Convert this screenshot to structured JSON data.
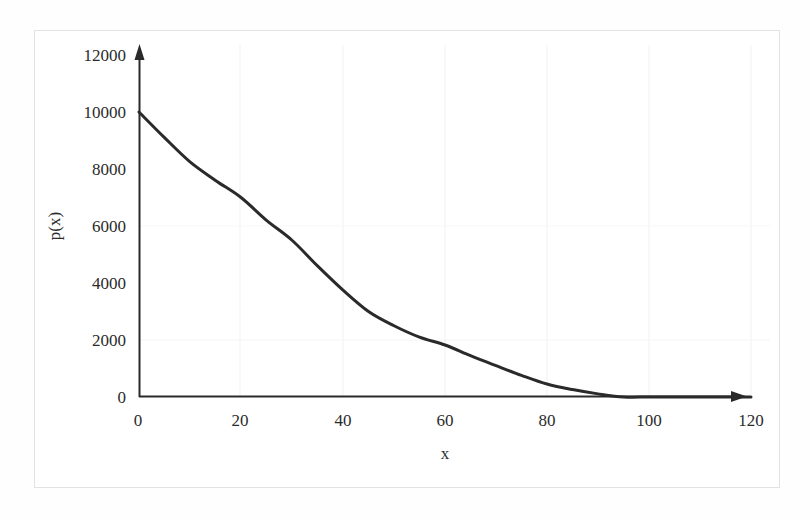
{
  "chart_data": {
    "type": "line",
    "title": "",
    "xlabel": "x",
    "ylabel": "p(x)",
    "xlim": [
      0,
      120
    ],
    "ylim": [
      0,
      12000
    ],
    "xticks": [
      0,
      20,
      40,
      60,
      80,
      100,
      120
    ],
    "yticks": [
      0,
      2000,
      4000,
      6000,
      8000,
      10000,
      12000
    ],
    "xtick_labels": [
      "0",
      "20",
      "40",
      "60",
      "80",
      "100",
      "120"
    ],
    "ytick_labels": [
      "0",
      "2000",
      "4000",
      "6000",
      "8000",
      "10000",
      "12000"
    ],
    "grid": "faint-vertical-and-horizontal",
    "legend": "none",
    "series": [
      {
        "name": "p(x)",
        "color": "#2a2a2a",
        "line_width": 3,
        "x": [
          0,
          5,
          10,
          15,
          20,
          25,
          30,
          35,
          40,
          45,
          50,
          55,
          60,
          65,
          70,
          75,
          80,
          85,
          90,
          95,
          100,
          105,
          110,
          115,
          120
        ],
        "y": [
          10000,
          9100,
          8250,
          7600,
          7000,
          6200,
          5500,
          4600,
          3750,
          3000,
          2500,
          2100,
          1825,
          1450,
          1100,
          760,
          456,
          260,
          110,
          0,
          0,
          0,
          0,
          0,
          0
        ]
      }
    ],
    "axis_style": {
      "x_axis_arrow": true,
      "y_axis_arrow": true,
      "axis_color": "#2a2a2a",
      "spines": "arrow-axes-origin-at-zero"
    }
  },
  "figure": {
    "border_color": "#e2e2e2",
    "background": "#ffffff"
  }
}
